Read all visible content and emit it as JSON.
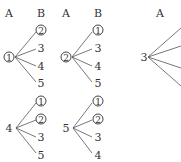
{
  "headers": {
    "col1_a": "A",
    "col1_b": "B",
    "col2_a": "A",
    "col2_b": "B",
    "col3_a": "A"
  },
  "trees": [
    {
      "root": "1",
      "root_circled": true,
      "leaves": [
        {
          "label": "2",
          "circled": true
        },
        {
          "label": "3",
          "circled": false
        },
        {
          "label": "4",
          "circled": false
        },
        {
          "label": "5",
          "circled": false
        }
      ]
    },
    {
      "root": "2",
      "root_circled": true,
      "leaves": [
        {
          "label": "1",
          "circled": false
        },
        {
          "label": "3",
          "circled": false
        },
        {
          "label": "4",
          "circled": false
        },
        {
          "label": "5",
          "circled": false
        }
      ]
    },
    {
      "root": "3",
      "root_circled": false,
      "leaves": []
    },
    {
      "root": "4",
      "root_circled": false,
      "leaves": [
        {
          "label": "1",
          "circled": true
        },
        {
          "label": "2",
          "circled": true
        },
        {
          "label": "3",
          "circled": false
        },
        {
          "label": "5",
          "circled": false
        }
      ]
    },
    {
      "root": "5",
      "root_circled": false,
      "leaves": [
        {
          "label": "1",
          "circled": true
        },
        {
          "label": "2",
          "circled": true
        },
        {
          "label": "3",
          "circled": false
        },
        {
          "label": "4",
          "circled": false
        }
      ]
    }
  ]
}
